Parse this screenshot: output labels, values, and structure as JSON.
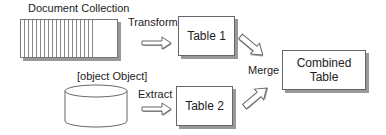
{
  "diagram": {
    "sources": {
      "document_collection": {
        "label": "Document Collection"
      },
      "database": {
        "label": "Database"
      }
    },
    "operations": {
      "transform": "Transform",
      "extract": "Extract",
      "merge": "Merge"
    },
    "tables": {
      "table1": "Table 1",
      "table2": "Table 2",
      "combined_line1": "Combined",
      "combined_line2": "Table"
    }
  }
}
